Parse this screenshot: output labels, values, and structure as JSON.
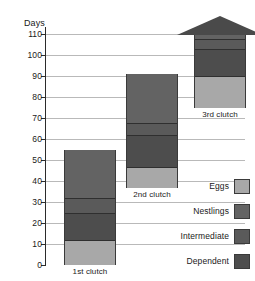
{
  "chart_data": {
    "type": "bar",
    "subtype": "stacked-floating-bar",
    "title": "",
    "xlabel": "",
    "ylabel": "Days",
    "ylim": [
      0,
      110
    ],
    "yticks": [
      0,
      10,
      20,
      30,
      40,
      50,
      60,
      70,
      80,
      90,
      100,
      110
    ],
    "grid": true,
    "legend_position": "bottom-right",
    "categories": [
      "1st clutch",
      "2nd clutch",
      "3rd clutch"
    ],
    "stack_order": [
      "Eggs",
      "Dependent",
      "Intermediate",
      "Nestlings"
    ],
    "series": [
      {
        "name": "Eggs",
        "color": "#a8a8a8",
        "values": [
          12,
          10,
          15
        ]
      },
      {
        "name": "Dependent",
        "color": "#4d4d4d",
        "values": [
          13,
          15,
          13
        ]
      },
      {
        "name": "Intermediate",
        "color": "#5a5a5a",
        "values": [
          7,
          6,
          5
        ]
      },
      {
        "name": "Nestlings",
        "color": "#636363",
        "values": [
          23,
          23,
          14
        ]
      }
    ],
    "bars": [
      {
        "label": "1st clutch",
        "base": 0,
        "top": 55,
        "truncated": false,
        "segments": [
          {
            "name": "Eggs",
            "from": 0,
            "to": 12,
            "color": "#a8a8a8"
          },
          {
            "name": "Dependent",
            "from": 12,
            "to": 25,
            "color": "#4d4d4d"
          },
          {
            "name": "Intermediate",
            "from": 25,
            "to": 32,
            "color": "#5a5a5a"
          },
          {
            "name": "Nestlings",
            "from": 32,
            "to": 55,
            "color": "#636363"
          }
        ]
      },
      {
        "label": "2nd clutch",
        "base": 37,
        "top": 91,
        "truncated": false,
        "segments": [
          {
            "name": "Eggs",
            "from": 37,
            "to": 47,
            "color": "#a8a8a8"
          },
          {
            "name": "Dependent",
            "from": 47,
            "to": 62,
            "color": "#4d4d4d"
          },
          {
            "name": "Intermediate",
            "from": 62,
            "to": 68,
            "color": "#5a5a5a"
          },
          {
            "name": "Nestlings",
            "from": 68,
            "to": 91,
            "color": "#636363"
          }
        ]
      },
      {
        "label": "3rd clutch",
        "base": 75,
        "top": 110,
        "truncated": true,
        "arrow": true,
        "segments": [
          {
            "name": "Eggs",
            "from": 75,
            "to": 90,
            "color": "#a8a8a8"
          },
          {
            "name": "Dependent",
            "from": 90,
            "to": 103,
            "color": "#4d4d4d"
          },
          {
            "name": "Intermediate",
            "from": 103,
            "to": 108,
            "color": "#5a5a5a"
          },
          {
            "name": "Nestlings",
            "from": 108,
            "to": 110,
            "color": "#636363"
          }
        ]
      }
    ],
    "legend": [
      {
        "label": "Eggs",
        "color": "#a8a8a8"
      },
      {
        "label": "Nestlings",
        "color": "#636363"
      },
      {
        "label": "Intermediate",
        "color": "#5a5a5a"
      },
      {
        "label": "Dependent",
        "color": "#4d4d4d"
      }
    ],
    "arrow_color": "#4a4a4a"
  },
  "axis": {
    "y_title": "Days"
  }
}
